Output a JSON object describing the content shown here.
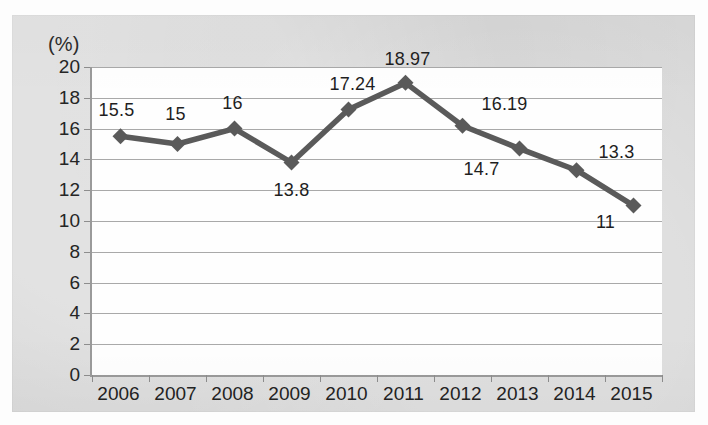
{
  "chart_data": {
    "type": "line",
    "title": "",
    "xlabel": "",
    "ylabel": "(%)",
    "unit_label": "(%)",
    "categories": [
      "2006",
      "2007",
      "2008",
      "2009",
      "2010",
      "2011",
      "2012",
      "2013",
      "2014",
      "2015"
    ],
    "values": [
      15.5,
      15,
      16,
      13.8,
      17.24,
      18.97,
      16.19,
      14.7,
      13.3,
      11
    ],
    "point_labels": [
      "15.5",
      "15",
      "16",
      "13.8",
      "17.24",
      "18.97",
      "16.19",
      "14.7",
      "13.3",
      "11"
    ],
    "ylim": [
      0,
      20
    ],
    "ytick_step": 2,
    "yticks": [
      "20",
      "18",
      "16",
      "14",
      "12",
      "10",
      "8",
      "6",
      "4",
      "2",
      "0"
    ],
    "grid": true,
    "legend": "none",
    "series_color": "#5a5a5a",
    "marker": "diamond",
    "background_color": "#d6d6d6",
    "plot_background_color": "#fefefe",
    "gridline_color": "#a9a9a9",
    "axis_color": "#9a9a9a",
    "text_color": "#232323"
  },
  "label_offsets": [
    {
      "dx": -2,
      "dy": -26
    },
    {
      "dx": 0,
      "dy": -30
    },
    {
      "dx": 0,
      "dy": -26
    },
    {
      "dx": 2,
      "dy": 28
    },
    {
      "dx": 6,
      "dy": -26
    },
    {
      "dx": 4,
      "dy": -24
    },
    {
      "dx": 44,
      "dy": -22
    },
    {
      "dx": -36,
      "dy": 20
    },
    {
      "dx": 42,
      "dy": -18
    },
    {
      "dx": -26,
      "dy": 16
    }
  ]
}
